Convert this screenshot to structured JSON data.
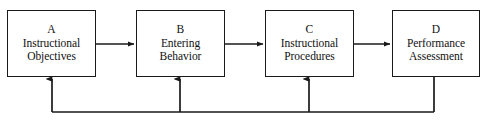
{
  "diagram": {
    "type": "flow-diagram",
    "width": 486,
    "height": 121,
    "background_color": "#ffffff",
    "line_color": "#1a1a1a",
    "text_color": "#111111",
    "nodes": [
      {
        "id": "A",
        "letter": "A",
        "line1": "Instructional",
        "line2": "Objectives",
        "x": 7,
        "y": 10,
        "width": 89,
        "height": 67
      },
      {
        "id": "B",
        "letter": "B",
        "line1": "Entering",
        "line2": "Behavior",
        "x": 136,
        "y": 10,
        "width": 89,
        "height": 67
      },
      {
        "id": "C",
        "letter": "C",
        "line1": "Instructional",
        "line2": "Procedures",
        "x": 265,
        "y": 10,
        "width": 89,
        "height": 67
      },
      {
        "id": "D",
        "letter": "D",
        "line1": "Performance",
        "line2": "Assessment",
        "x": 392,
        "y": 10,
        "width": 88,
        "height": 67
      }
    ],
    "forward_arrows": [
      {
        "name": "arrow-a-to-b",
        "from": "A",
        "to": "B",
        "x1": 96,
        "x2": 134,
        "y": 44
      },
      {
        "name": "arrow-b-to-c",
        "from": "B",
        "to": "C",
        "x1": 225,
        "x2": 263,
        "y": 44
      },
      {
        "name": "arrow-c-to-d",
        "from": "C",
        "to": "D",
        "x1": 354,
        "x2": 390,
        "y": 44
      }
    ],
    "feedback_loop": {
      "name": "feedback-loop",
      "source_node": "D",
      "source_x": 434,
      "source_y": 77,
      "bus_y": 112,
      "bus_x_left": 52,
      "branches": [
        {
          "name": "feedback-arrow-to-a",
          "to": "A",
          "x": 52,
          "y_top": 79
        },
        {
          "name": "feedback-arrow-to-b",
          "to": "B",
          "x": 180,
          "y_top": 79
        },
        {
          "name": "feedback-arrow-to-c",
          "to": "C",
          "x": 309,
          "y_top": 79
        }
      ]
    }
  }
}
